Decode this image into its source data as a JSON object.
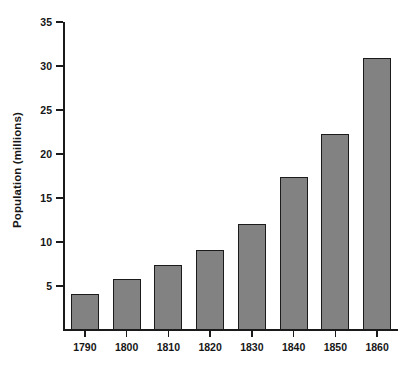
{
  "chart_data": {
    "type": "bar",
    "title": "",
    "subtitle": "",
    "xlabel": "",
    "ylabel": "Population (millions)",
    "categories": [
      "1790",
      "1800",
      "1810",
      "1820",
      "1830",
      "1840",
      "1850",
      "1860"
    ],
    "values": [
      4.1,
      5.8,
      7.4,
      9.1,
      12.0,
      17.4,
      22.3,
      30.9
    ],
    "series": [
      {
        "name": "Population",
        "values": [
          4.1,
          5.8,
          7.4,
          9.1,
          12.0,
          17.4,
          22.3,
          30.9
        ]
      }
    ],
    "ylim": [
      0,
      35
    ],
    "yticks": [
      5,
      10,
      15,
      20,
      25,
      30,
      35
    ],
    "ytick_labels": [
      "5",
      "10",
      "15",
      "20",
      "25",
      "30",
      "35"
    ],
    "xtick_labels": [
      "1790",
      "1800",
      "1810",
      "1820",
      "1830",
      "1840",
      "1850",
      "1860"
    ],
    "grid": false,
    "legend": false,
    "legend_position": "none",
    "annotations": [],
    "colors": {
      "bar_fill": "#828282",
      "bar_border": "#1b1b1b",
      "axis": "#1a1a1a",
      "text": "#161616",
      "background": "#ffffff"
    }
  }
}
